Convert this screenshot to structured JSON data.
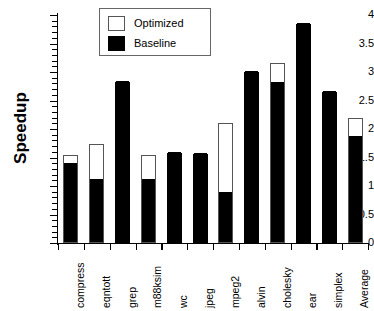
{
  "chart_data": {
    "type": "bar",
    "title": "",
    "subtitle": "",
    "xlabel": "",
    "ylabel": "Speedup",
    "ylim": [
      0,
      4
    ],
    "grid": false,
    "stacked_overlay": true,
    "legend_position": "top-center",
    "y_ticks": [
      {
        "value": 0,
        "label": "0"
      },
      {
        "value": 0.5,
        "label": "0.5"
      },
      {
        "value": 1,
        "label": "1"
      },
      {
        "value": 1.5,
        "label": "1.5"
      },
      {
        "value": 2,
        "label": "2"
      },
      {
        "value": 2.5,
        "label": "2.5"
      },
      {
        "value": 3,
        "label": "3"
      },
      {
        "value": 3.5,
        "label": "3.5"
      },
      {
        "value": 4,
        "label": "4"
      }
    ],
    "y_minor_step": 0.1,
    "categories": [
      "compress",
      "eqntott",
      "grep",
      "m88ksim",
      "wc",
      "jpeg",
      "mpeg2",
      "alvin",
      "cholesky",
      "ear",
      "simplex",
      "Average"
    ],
    "series": [
      {
        "name": "Optimized",
        "color": "#ffffff",
        "edge_color": "#555555",
        "values": [
          1.55,
          1.73,
          2.83,
          1.55,
          1.58,
          1.57,
          2.1,
          3.0,
          3.15,
          3.85,
          2.65,
          2.2
        ]
      },
      {
        "name": "Baseline",
        "color": "#000000",
        "edge_color": "#000000",
        "values": [
          1.4,
          1.13,
          2.83,
          1.12,
          1.58,
          1.57,
          0.9,
          3.0,
          2.83,
          3.85,
          2.65,
          1.88
        ]
      }
    ]
  },
  "legend": {
    "entries": [
      {
        "label": "Optimized",
        "style": "outline"
      },
      {
        "label": "Baseline",
        "style": "filled"
      }
    ]
  }
}
